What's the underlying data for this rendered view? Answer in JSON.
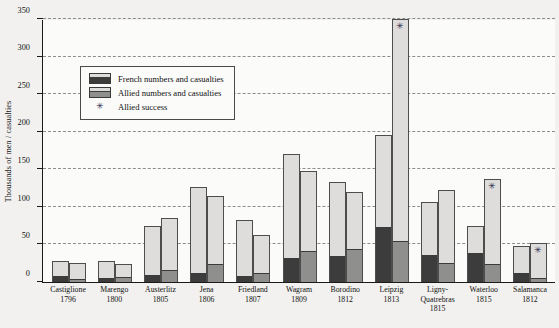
{
  "chart_data": {
    "type": "bar",
    "title": "The Butcher's bill:  numbers and losses in battle",
    "xlabel": "",
    "ylabel": "Thousands of men / casualties",
    "ylim": [
      0,
      350
    ],
    "ytick_step": 50,
    "yticks": [
      "0",
      "50",
      "100",
      "150",
      "200",
      "250",
      "300",
      "350"
    ],
    "grid": "horizontal dashed",
    "legend_position": "inside upper-left",
    "legend": [
      {
        "label": "French numbers and casualties",
        "swatch": "bar-with-dark-loss-segment",
        "color_total": "#dedddb",
        "color_loss": "#3c3c3c"
      },
      {
        "label": "Allied numbers and casualties",
        "swatch": "bar-with-gray-loss-segment",
        "color_total": "#dedddb",
        "color_loss": "#8f8f8d"
      },
      {
        "label": "Allied success",
        "swatch": "asterisk-marker",
        "color_total": "#27274c",
        "color_loss": "#27274c"
      }
    ],
    "marker_symbol": "✳",
    "categories": [
      {
        "name": "Castiglione",
        "year": "1796"
      },
      {
        "name": "Marengo",
        "year": "1800"
      },
      {
        "name": "Austerlitz",
        "year": "1805"
      },
      {
        "name": "Jena",
        "year": "1806"
      },
      {
        "name": "Friedland",
        "year": "1807"
      },
      {
        "name": "Wagram",
        "year": "1809"
      },
      {
        "name": "Borodino",
        "year": "1812"
      },
      {
        "name": "Leipzig",
        "year": "1813"
      },
      {
        "name": "Ligny-Quatrebras",
        "year": "1815"
      },
      {
        "name": "Waterloo",
        "year": "1815"
      },
      {
        "name": "Salamanca",
        "year": "1812"
      }
    ],
    "series": [
      {
        "name": "French numbers and casualties",
        "values": [
          28,
          28,
          75,
          126,
          82,
          171,
          133,
          195,
          107,
          75,
          48
        ],
        "losses": [
          8,
          6,
          9,
          12,
          8,
          32,
          35,
          73,
          36,
          38,
          12
        ]
      },
      {
        "name": "Allied numbers and casualties",
        "values": [
          25,
          24,
          85,
          115,
          62,
          148,
          120,
          350,
          122,
          137,
          52
        ],
        "losses": [
          4,
          7,
          16,
          24,
          12,
          41,
          44,
          54,
          25,
          24,
          6
        ]
      }
    ],
    "allied_success_markers": [
      "Leipzig",
      "Waterloo",
      "Salamanca"
    ]
  }
}
